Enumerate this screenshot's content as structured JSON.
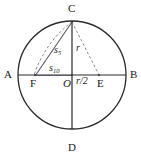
{
  "figure": {
    "background_color": "#ffffff",
    "stroke_color": "#2b2b2b",
    "dash_color": "#7a7a7a",
    "solid_color": "#5a5a6a"
  },
  "circle": {
    "center_label": "O",
    "cx": 72,
    "cy": 75,
    "r": 54
  },
  "points": [
    {
      "id": "A",
      "label": "A",
      "x": 18,
      "y": 75,
      "label_x": 4,
      "label_y": 69
    },
    {
      "id": "B",
      "label": "B",
      "x": 126,
      "y": 75,
      "label_x": 130,
      "label_y": 69
    },
    {
      "id": "C",
      "label": "C",
      "x": 72,
      "y": 21,
      "label_x": 68,
      "label_y": 4
    },
    {
      "id": "D",
      "label": "D",
      "x": 72,
      "y": 129,
      "label_x": 68,
      "label_y": 141
    },
    {
      "id": "O",
      "label": "O",
      "x": 72,
      "y": 75,
      "label_x": 64,
      "label_y": 78
    },
    {
      "id": "E",
      "label": "E",
      "x": 99,
      "y": 75,
      "label_x": 97,
      "label_y": 78
    },
    {
      "id": "F",
      "label": "F",
      "x": 35,
      "y": 75,
      "label_x": 30,
      "label_y": 78
    }
  ],
  "segment_labels": [
    {
      "id": "s5",
      "base": "s",
      "sub": "5",
      "text": "s5",
      "x": 55,
      "y": 46
    },
    {
      "id": "s10",
      "base": "s",
      "sub": "10",
      "text": "s10",
      "x": 50,
      "y": 64
    },
    {
      "id": "r",
      "base": "r",
      "sub": "",
      "text": "r",
      "x": 76,
      "y": 44
    },
    {
      "id": "rhalf",
      "base": "r/2",
      "sub": "",
      "text": "r/2",
      "x": 77,
      "y": 76
    }
  ],
  "lines": {
    "diameter_horizontal": {
      "from": "A",
      "to": "B",
      "style": "solid"
    },
    "diameter_vertical": {
      "from": "C",
      "to": "D",
      "style": "solid"
    },
    "chord_CF": {
      "from": "C",
      "to": "F",
      "style": "solid"
    },
    "radius_CE": {
      "from": "C",
      "to": "E",
      "style": "dashed"
    },
    "arc_EF": {
      "from": "E",
      "to": "F",
      "style": "dashed",
      "note": "arc centred at C through E meeting AB at F"
    },
    "segment_FO": {
      "from": "F",
      "to": "O",
      "style": "solid",
      "note": "s10 measured along AB"
    }
  }
}
